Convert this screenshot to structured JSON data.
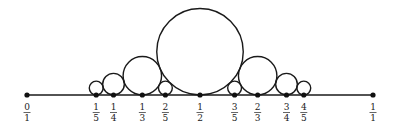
{
  "diagram": {
    "colors": {
      "stroke": "#1a1a1a",
      "point": "#111111",
      "label": "#222222"
    },
    "points": [
      {
        "p": 0,
        "q": 1,
        "num": "0",
        "den": "1",
        "circle": false
      },
      {
        "p": 1,
        "q": 5,
        "num": "1",
        "den": "5",
        "circle": true
      },
      {
        "p": 1,
        "q": 4,
        "num": "1",
        "den": "4",
        "circle": true
      },
      {
        "p": 1,
        "q": 3,
        "num": "1",
        "den": "3",
        "circle": true
      },
      {
        "p": 2,
        "q": 5,
        "num": "2",
        "den": "5",
        "circle": true
      },
      {
        "p": 1,
        "q": 2,
        "num": "1",
        "den": "2",
        "circle": true
      },
      {
        "p": 3,
        "q": 5,
        "num": "3",
        "den": "5",
        "circle": true
      },
      {
        "p": 2,
        "q": 3,
        "num": "2",
        "den": "3",
        "circle": true
      },
      {
        "p": 3,
        "q": 4,
        "num": "3",
        "den": "4",
        "circle": true
      },
      {
        "p": 4,
        "q": 5,
        "num": "4",
        "den": "5",
        "circle": true
      },
      {
        "p": 1,
        "q": 1,
        "num": "1",
        "den": "1",
        "circle": false
      }
    ]
  }
}
